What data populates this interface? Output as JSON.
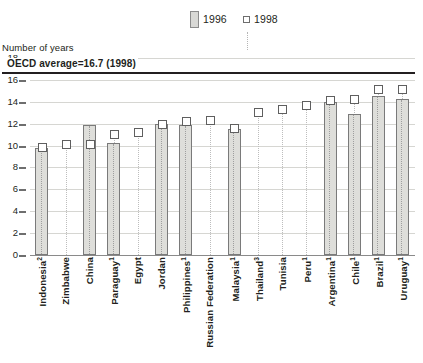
{
  "axis_title": "Number of years",
  "legend": [
    {
      "label": "1996",
      "type": "bar",
      "color": "#d9d9d6"
    },
    {
      "label": "1998",
      "type": "marker",
      "color": "#ffffff"
    }
  ],
  "annotation": {
    "oecd_label": "OECD average=16.7 (1998)",
    "oecd_value": 16.7
  },
  "chart_data": {
    "type": "bar",
    "title": "",
    "subtitle": "",
    "xlabel": "",
    "ylabel": "Number of years",
    "ylim": [
      0,
      18
    ],
    "yticks": [
      0,
      2,
      4,
      6,
      8,
      10,
      12,
      14,
      16,
      18
    ],
    "grid": true,
    "legend_position": "top-center",
    "categories": [
      "Indonesia",
      "Zimbabwe",
      "China",
      "Paraguay",
      "Egypt",
      "Jordan",
      "Philippines",
      "Russian Federation",
      "Malaysia",
      "Thailand",
      "Tunisia",
      "Peru",
      "Argentina",
      "Chile",
      "Brazil",
      "Uruguay"
    ],
    "category_footnotes": [
      "2",
      "",
      "",
      "1",
      "",
      "",
      "1",
      "",
      "1",
      "3",
      "",
      "1",
      "1",
      "1",
      "1",
      "1"
    ],
    "series": [
      {
        "name": "1996",
        "type": "bar",
        "values": [
          9.8,
          null,
          11.9,
          10.2,
          null,
          12.0,
          11.9,
          null,
          11.5,
          null,
          null,
          null,
          14.0,
          12.9,
          14.5,
          14.3
        ]
      },
      {
        "name": "1998",
        "type": "marker",
        "values": [
          9.8,
          10.1,
          10.1,
          11.0,
          11.2,
          11.9,
          12.2,
          12.3,
          11.6,
          13.0,
          13.3,
          13.7,
          14.1,
          14.2,
          15.1,
          15.1
        ]
      }
    ],
    "annotations": [
      {
        "text": "OECD average=16.7 (1998)",
        "type": "hline",
        "value": 16.7
      }
    ]
  }
}
